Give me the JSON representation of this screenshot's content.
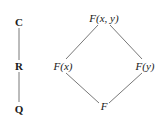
{
  "diagrams": {
    "chain": {
      "nodes": [
        {
          "id": "C",
          "label": "C"
        },
        {
          "id": "R",
          "label": "R"
        },
        {
          "id": "Q",
          "label": "Q"
        }
      ],
      "edges": [
        [
          "C",
          "R"
        ],
        [
          "R",
          "Q"
        ]
      ]
    },
    "diamond": {
      "nodes": [
        {
          "id": "Fxy",
          "label": "F(x, y)"
        },
        {
          "id": "Fx",
          "label": "F(x)"
        },
        {
          "id": "Fy",
          "label": "F(y)"
        },
        {
          "id": "F",
          "label": "F"
        }
      ],
      "edges": [
        [
          "Fxy",
          "Fx"
        ],
        [
          "Fxy",
          "Fy"
        ],
        [
          "Fx",
          "F"
        ],
        [
          "Fy",
          "F"
        ]
      ]
    }
  }
}
